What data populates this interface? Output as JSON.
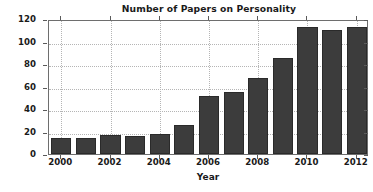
{
  "chart_data": {
    "type": "bar",
    "title": "Number of Papers on Personality",
    "xlabel": "Year",
    "ylabel": "Number of Papers",
    "categories": [
      2000,
      2001,
      2002,
      2003,
      2004,
      2005,
      2006,
      2007,
      2008,
      2009,
      2010,
      2011,
      2012
    ],
    "values": [
      14,
      14,
      17,
      16,
      18,
      26,
      52,
      55,
      68,
      85,
      113,
      110,
      113
    ],
    "series": [
      {
        "name": "Number of Papers",
        "values": [
          14,
          14,
          17,
          16,
          18,
          26,
          52,
          55,
          68,
          85,
          113,
          110,
          113
        ]
      }
    ],
    "xlim": [
      1999.5,
      2012.5
    ],
    "ylim": [
      0,
      120
    ],
    "ytick_labels": [
      "0",
      "20",
      "40",
      "60",
      "80",
      "100",
      "120"
    ],
    "ytick_values": [
      0,
      20,
      40,
      60,
      80,
      100,
      120
    ],
    "xtick_labels": [
      "2000",
      "2002",
      "2004",
      "2006",
      "2008",
      "2010",
      "2012"
    ],
    "xtick_values": [
      2000,
      2002,
      2004,
      2006,
      2008,
      2010,
      2012
    ],
    "grid": true,
    "legend": false,
    "bar_color": "#3c3c3c",
    "grid_color": "#b5b5b5",
    "axis_color": "#6e6e6e",
    "background_color": "#ffffff"
  }
}
